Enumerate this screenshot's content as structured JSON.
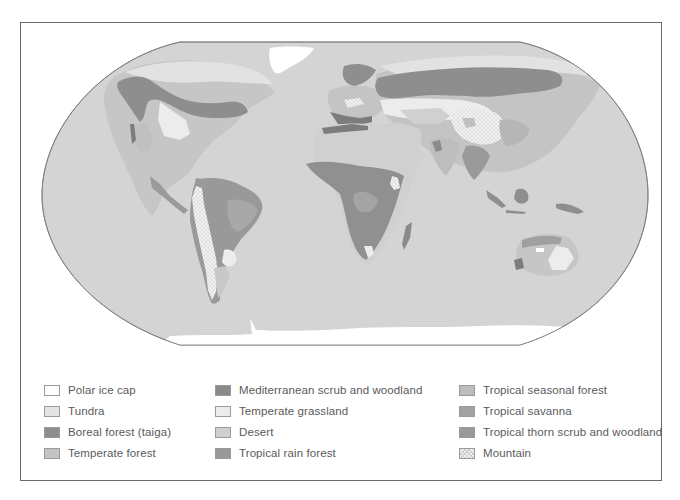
{
  "map": {
    "title": "World biomes map",
    "projection": "Robinson-style elliptical world map",
    "ocean_color": "#d4d4d4",
    "outline_color": "#777777",
    "regions": [
      {
        "name": "North America",
        "biomes": [
          "Boreal forest (taiga)",
          "Tundra",
          "Temperate grassland",
          "Temperate forest",
          "Desert",
          "Mediterranean scrub and woodland",
          "Mountain"
        ]
      },
      {
        "name": "Greenland",
        "biomes": [
          "Polar ice cap"
        ]
      },
      {
        "name": "Central America",
        "biomes": [
          "Tropical rain forest",
          "Tropical seasonal forest"
        ]
      },
      {
        "name": "South America",
        "biomes": [
          "Tropical rain forest",
          "Tropical savanna",
          "Tropical thorn scrub and woodland",
          "Mountain",
          "Temperate grassland",
          "Desert"
        ]
      },
      {
        "name": "Europe",
        "biomes": [
          "Boreal forest (taiga)",
          "Temperate forest",
          "Mediterranean scrub and woodland",
          "Mountain"
        ]
      },
      {
        "name": "Africa",
        "biomes": [
          "Desert",
          "Tropical rain forest",
          "Tropical savanna",
          "Tropical seasonal forest",
          "Mountain",
          "Mediterranean scrub and woodland"
        ]
      },
      {
        "name": "Asia",
        "biomes": [
          "Boreal forest (taiga)",
          "Tundra",
          "Temperate grassland",
          "Desert",
          "Mountain",
          "Temperate forest",
          "Tropical seasonal forest",
          "Tropical rain forest"
        ]
      },
      {
        "name": "Southeast Asia",
        "biomes": [
          "Tropical rain forest",
          "Tropical seasonal forest"
        ]
      },
      {
        "name": "Australia",
        "biomes": [
          "Desert",
          "Tropical savanna",
          "Temperate grassland",
          "Mediterranean scrub and woodland",
          "Temperate forest"
        ]
      },
      {
        "name": "Antarctica",
        "biomes": [
          "Polar ice cap"
        ]
      }
    ]
  },
  "legend": {
    "items": [
      {
        "label": "Polar ice cap",
        "color": "#ffffff",
        "pattern": "solid"
      },
      {
        "label": "Tundra",
        "color": "#e4e4e4",
        "pattern": "solid"
      },
      {
        "label": "Boreal forest (taiga)",
        "color": "#8e8e8e",
        "pattern": "solid"
      },
      {
        "label": "Temperate forest",
        "color": "#c4c4c4",
        "pattern": "solid"
      },
      {
        "label": "Mediterranean scrub and woodland",
        "color": "#8a8a8a",
        "pattern": "solid"
      },
      {
        "label": "Temperate grassland",
        "color": "#ececec",
        "pattern": "solid"
      },
      {
        "label": "Desert",
        "color": "#d0d0d0",
        "pattern": "solid"
      },
      {
        "label": "Tropical rain forest",
        "color": "#999999",
        "pattern": "solid"
      },
      {
        "label": "Tropical seasonal forest",
        "color": "#bdbdbd",
        "pattern": "solid"
      },
      {
        "label": "Tropical savanna",
        "color": "#a2a2a2",
        "pattern": "solid"
      },
      {
        "label": "Tropical thorn scrub and woodland",
        "color": "#999999",
        "pattern": "solid"
      },
      {
        "label": "Mountain",
        "color": "#f3f3f3",
        "pattern": "crosshatch"
      }
    ]
  }
}
